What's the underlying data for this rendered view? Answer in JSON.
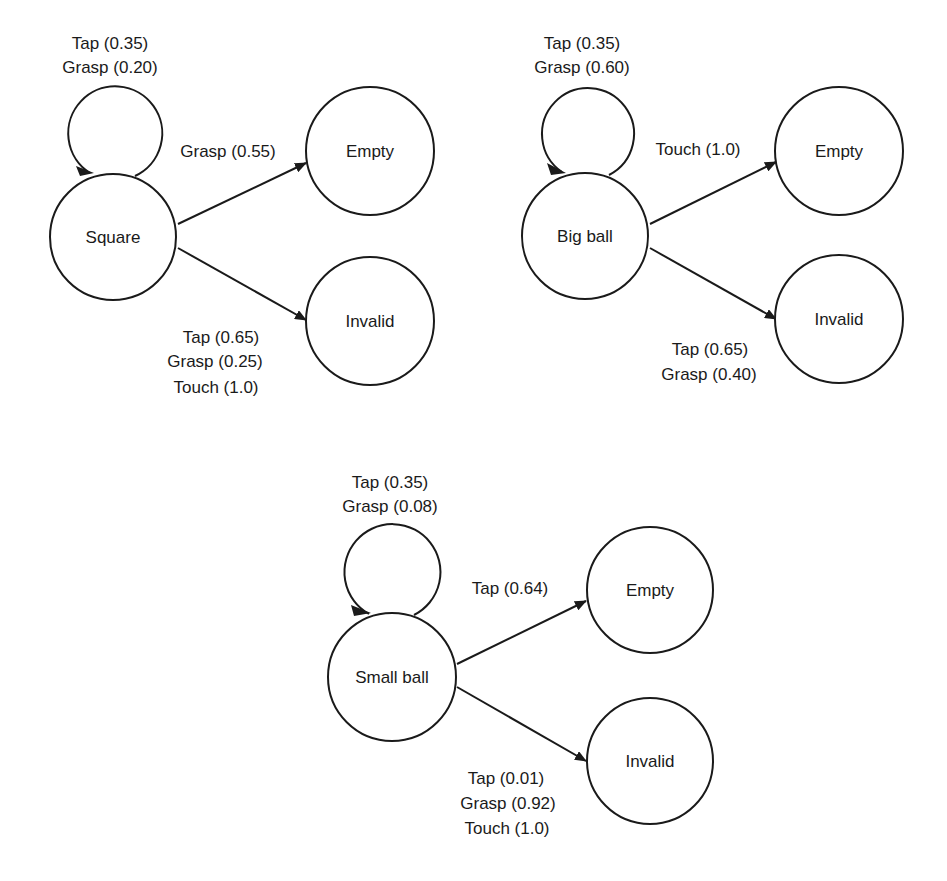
{
  "diagrams": [
    {
      "source": "Square",
      "self_loop": {
        "lines": [
          "Tap (0.35)",
          "Grasp (0.20)"
        ]
      },
      "to_empty": {
        "target": "Empty",
        "lines": [
          "Grasp (0.55)"
        ]
      },
      "to_invalid": {
        "target": "Invalid",
        "lines": [
          "Tap (0.65)",
          "Grasp (0.25)",
          "Touch (1.0)"
        ]
      }
    },
    {
      "source": "Big ball",
      "self_loop": {
        "lines": [
          "Tap (0.35)",
          "Grasp (0.60)"
        ]
      },
      "to_empty": {
        "target": "Empty",
        "lines": [
          "Touch (1.0)"
        ]
      },
      "to_invalid": {
        "target": "Invalid",
        "lines": [
          "Tap (0.65)",
          "Grasp (0.40)"
        ]
      }
    },
    {
      "source": "Small ball",
      "self_loop": {
        "lines": [
          "Tap (0.35)",
          "Grasp (0.08)"
        ]
      },
      "to_empty": {
        "target": "Empty",
        "lines": [
          "Tap (0.64)"
        ]
      },
      "to_invalid": {
        "target": "Invalid",
        "lines": [
          "Tap (0.01)",
          "Grasp (0.92)",
          "Touch (1.0)"
        ]
      }
    }
  ],
  "colors": {
    "stroke": "#1a1a1a",
    "background": "#ffffff"
  }
}
